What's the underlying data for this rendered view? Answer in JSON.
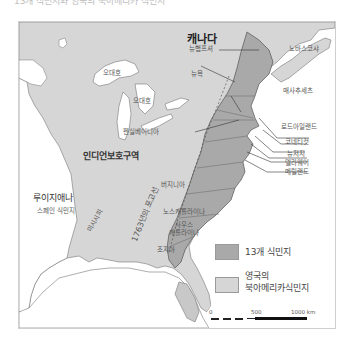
{
  "caption": "13개 식민지와 영국의 북아메리카 식민지",
  "colors": {
    "thirteen_colonies": "#a9a9a9",
    "british_na": "#d6d6d6",
    "water": "#ffffff",
    "indian_reserve": "#d6d6d6",
    "border": "#555555"
  },
  "map": {
    "regions": {
      "canada": "캐나다",
      "indian_reserve": "인디언보호구역",
      "louisiana": "루이지애나",
      "louisiana_sub": "스페인 식민지",
      "mississippi": "미시시피",
      "proclamation_line": "1763년의 포고선",
      "nova_scotia": "노바스코샤"
    },
    "lakes": {
      "superior": "오대호",
      "michigan": "오대호"
    },
    "colonies": [
      {
        "id": "new-hampshire",
        "label": "뉴햄프셔"
      },
      {
        "id": "new-york",
        "label": "뉴욕"
      },
      {
        "id": "massachusetts",
        "label": "매사추세츠"
      },
      {
        "id": "rhode-island",
        "label": "로드아일랜드"
      },
      {
        "id": "connecticut",
        "label": "코네티컷"
      },
      {
        "id": "new-jersey",
        "label": "뉴저지"
      },
      {
        "id": "delaware",
        "label": "델라웨어"
      },
      {
        "id": "maryland",
        "label": "메릴랜드"
      },
      {
        "id": "pennsylvania",
        "label": "펜실베이니아"
      },
      {
        "id": "virginia",
        "label": "버지니아"
      },
      {
        "id": "north-carolina",
        "label": "노스캐롤라이나"
      },
      {
        "id": "south-carolina",
        "label": "사우스\n캐롤라이나"
      },
      {
        "id": "georgia",
        "label": "조지아"
      }
    ]
  },
  "legend": {
    "items": [
      {
        "label": "13개 식민지",
        "color": "#a9a9a9"
      },
      {
        "label_line1": "영국의",
        "label_line2": "북아메리카식민지",
        "color": "#d6d6d6"
      }
    ]
  },
  "scale": {
    "ticks": [
      "0",
      "500",
      "1000 km"
    ]
  }
}
